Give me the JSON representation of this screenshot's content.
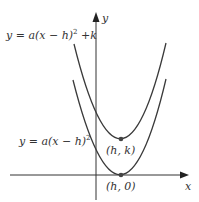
{
  "diagram": {
    "type": "parabola-translation",
    "equations": {
      "shifted": "y = a(x − h)² + k",
      "base": "y = a(x − h)²"
    },
    "axes": {
      "x_label": "x",
      "y_label": "y"
    },
    "points": [
      {
        "label": "(h, k)",
        "role": "vertex of shifted parabola"
      },
      {
        "label": "(h, 0)",
        "role": "vertex of base parabola"
      }
    ],
    "colors": {
      "curve": "#3a3a3a",
      "axis": "#333333",
      "text": "#333333",
      "point": "#444444"
    }
  },
  "labels": {
    "eq_top_prefix": "y = a(x − h)",
    "eq_top_sup": "2",
    "eq_top_suffix": " +k",
    "eq_bottom_prefix": "y = a(x − h)",
    "eq_bottom_sup": "2",
    "point_hk": "(h, k)",
    "point_h0": "(h, 0)",
    "x_axis": "x",
    "y_axis": "y"
  }
}
